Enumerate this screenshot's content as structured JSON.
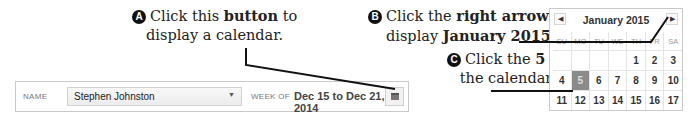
{
  "callouts": {
    "a": {
      "badge": "A",
      "pre": "Click this ",
      "bold": "button",
      "post": " to",
      "line2": "display a calendar."
    },
    "b": {
      "badge": "B",
      "pre": "Click the ",
      "bold": "right arrow",
      "post": " to",
      "line2_pre": "display ",
      "line2_bold": "January 2015",
      "line2_post": "."
    },
    "c": {
      "badge": "C",
      "pre": "Click the ",
      "bold": "5",
      "post": " on",
      "line2": "the calendar."
    }
  },
  "toolbar": {
    "name_label": "NAME",
    "name_value": "Stephen Johnston",
    "caret": "▼",
    "week_label": "WEEK OF",
    "week_value": "Dec 15 to Dec 21, 2014",
    "calendar_button_icon": "calendar-icon"
  },
  "calendar": {
    "month_label": "January 2015",
    "prev_arrow": "◀",
    "next_arrow": "▶",
    "weekdays": [
      "SU",
      "MO",
      "TU",
      "WE",
      "TH",
      "FR",
      "SA"
    ],
    "weeks": [
      [
        "",
        "",
        "",
        "",
        "1",
        "2",
        "3"
      ],
      [
        "4",
        "5",
        "6",
        "7",
        "8",
        "9",
        "10"
      ],
      [
        "11",
        "12",
        "13",
        "14",
        "15",
        "16",
        "17"
      ]
    ],
    "selected_day": "5"
  }
}
